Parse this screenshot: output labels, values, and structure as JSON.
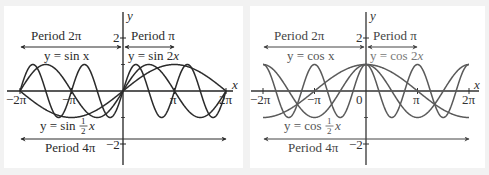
{
  "chart_data": [
    {
      "type": "line",
      "title": "",
      "xlabel": "x",
      "ylabel": "y",
      "xlim": [
        -6.2832,
        6.2832
      ],
      "ylim": [
        -2,
        2
      ],
      "grid": false,
      "x_ticks": [
        "-2π",
        "-π",
        "π",
        "2π"
      ],
      "y_ticks": [
        "2",
        "-2"
      ],
      "series": [
        {
          "name": "y = sin x",
          "function": "sin(x)",
          "period": "2π"
        },
        {
          "name": "y = sin 2x",
          "function": "sin(2x)",
          "period": "π"
        },
        {
          "name": "y = sin ½x",
          "function": "sin(x/2)",
          "period": "4π"
        }
      ],
      "annotations": [
        {
          "text": "Period 2π",
          "arrow_from": "-2π",
          "arrow_to": "0"
        },
        {
          "text": "Period π",
          "arrow_from": "0",
          "arrow_to": "π"
        },
        {
          "text": "Period 4π",
          "arrow_from": "-2π",
          "arrow_to": "2π"
        },
        {
          "text": "y = sin x"
        },
        {
          "text": "y = sin 2x"
        },
        {
          "text": "y = sin ½x"
        }
      ],
      "color": "#2b2b2b"
    },
    {
      "type": "line",
      "title": "",
      "xlabel": "x",
      "ylabel": "y",
      "xlim": [
        -6.2832,
        6.2832
      ],
      "ylim": [
        -2,
        2
      ],
      "grid": false,
      "x_ticks": [
        "-2π",
        "-π",
        "0",
        "π",
        "2π"
      ],
      "y_ticks": [
        "2",
        "-2"
      ],
      "series": [
        {
          "name": "y = cos x",
          "function": "cos(x)",
          "period": "2π"
        },
        {
          "name": "y = cos 2x",
          "function": "cos(2x)",
          "period": "π"
        },
        {
          "name": "y = cos ½x",
          "function": "cos(x/2)",
          "period": "4π"
        }
      ],
      "annotations": [
        {
          "text": "Period 2π",
          "arrow_from": "-2π",
          "arrow_to": "0"
        },
        {
          "text": "Period π",
          "arrow_from": "0",
          "arrow_to": "π"
        },
        {
          "text": "Period 4π",
          "arrow_from": "-2π",
          "arrow_to": "2π"
        },
        {
          "text": "y = cos x"
        },
        {
          "text": "y = cos 2x"
        },
        {
          "text": "y = cos ½x"
        }
      ],
      "color": "#5a5a5a"
    }
  ],
  "left": {
    "period_2pi": "Period 2π",
    "period_pi": "Period π",
    "period_4pi": "Period 4π",
    "label_sinx": "y = sin x",
    "label_sin2x_pre": "y = sin 2",
    "label_sin2x_var": "x",
    "label_sinhalf_pre": "y = sin",
    "label_var": "x",
    "frac_num": "1",
    "frac_den": "2",
    "tick_2": "2",
    "tick_neg2": "−2",
    "tick_neg2pi": "−2π",
    "tick_negpi": "−π",
    "tick_pi": "π",
    "tick_2pi": "2π",
    "axis_x": "x",
    "axis_y": "y"
  },
  "right": {
    "period_2pi": "Period 2π",
    "period_pi": "Period π",
    "period_4pi": "Period 4π",
    "label_cosx": "y = cos x",
    "label_cos2x_pre": "y = cos 2",
    "label_cos2x_var": "x",
    "label_coshalf_pre": "y = cos",
    "label_var": "x",
    "frac_num": "1",
    "frac_den": "2",
    "tick_2": "2",
    "tick_neg2": "−2",
    "tick_neg2pi": "−2π",
    "tick_negpi": "−π",
    "tick_0": "0",
    "tick_pi": "π",
    "tick_2pi": "2π",
    "axis_x": "x",
    "axis_y": "y"
  }
}
